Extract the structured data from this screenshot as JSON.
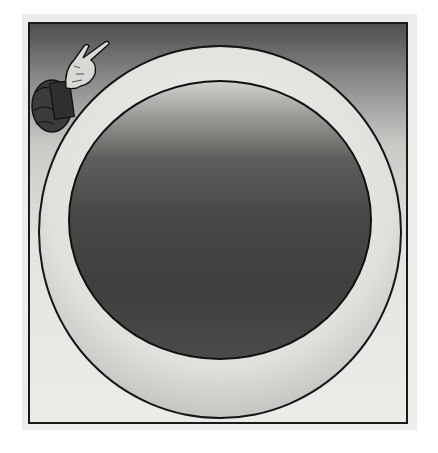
{
  "image": {
    "description": "Woodcut illustration: a divine hand emerging from clouds at upper left, beside a large concentric circle (dark inner sphere within a lighter ring) enclosed in a rectangular frame",
    "elements": [
      "frame",
      "outer-ring",
      "inner-disc",
      "hand-of-god",
      "cloud-sleeve"
    ],
    "colors": {
      "background": "#ffffff",
      "paper": "#ececea",
      "frame_line": "#1a1a1a",
      "sky_top": "#4e4e4e",
      "inner_disc": "#474746",
      "ring": "#e0e0dc"
    }
  }
}
